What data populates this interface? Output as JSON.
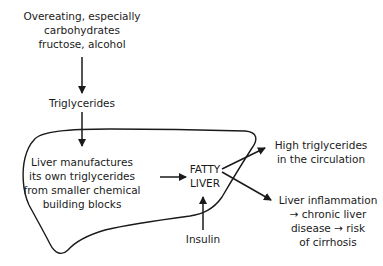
{
  "diagram": {
    "colors": {
      "ink": "#1a1a1a",
      "background": "#ffffff"
    },
    "nodes": {
      "overeating": {
        "lines": [
          "Overeating, especially",
          "carbohydrates",
          "fructose, alcohol"
        ]
      },
      "triglycerides": {
        "lines": [
          "Triglycerides"
        ]
      },
      "liver_manufactures": {
        "lines": [
          "Liver manufactures",
          "its own triglycerides",
          "from smaller chemical",
          "building blocks"
        ]
      },
      "fatty_liver": {
        "lines": [
          "FATTY",
          "LIVER"
        ]
      },
      "insulin": {
        "lines": [
          "Insulin"
        ]
      },
      "high_triglycerides": {
        "lines": [
          "High triglycerides",
          "in the circulation"
        ]
      },
      "liver_inflammation": {
        "lines": [
          "Liver inflammation",
          "→ chronic liver",
          "disease → risk",
          "of cirrhosis"
        ]
      }
    },
    "edges": [
      {
        "from": "overeating",
        "to": "triglycerides"
      },
      {
        "from": "triglycerides",
        "to": "liver_manufactures"
      },
      {
        "from": "liver_manufactures",
        "to": "fatty_liver"
      },
      {
        "from": "insulin",
        "to": "fatty_liver"
      },
      {
        "from": "fatty_liver",
        "to": "high_triglycerides"
      },
      {
        "from": "fatty_liver",
        "to": "liver_inflammation"
      }
    ],
    "shapes": [
      {
        "name": "liver-outline",
        "type": "freeform-outline"
      }
    ]
  }
}
